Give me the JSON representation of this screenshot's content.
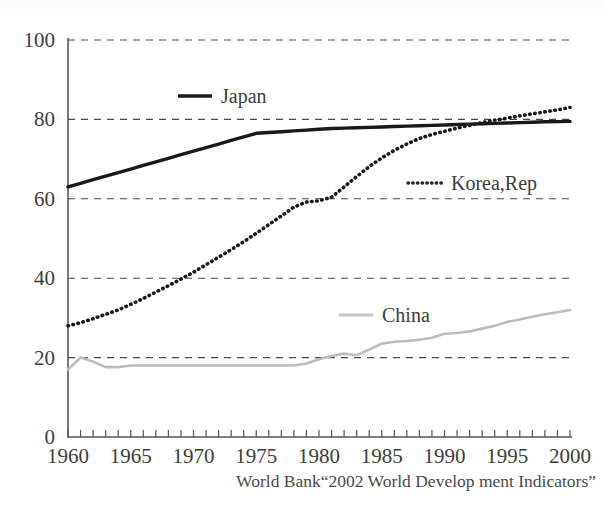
{
  "chart_data": {
    "type": "line",
    "title": "",
    "subtitle": "",
    "xlabel": "",
    "ylabel": "",
    "xlim": [
      1960,
      2000
    ],
    "ylim": [
      0,
      100
    ],
    "grid": true,
    "legend_position": "inline-near-series",
    "x_tick_labels": [
      "1960",
      "1965",
      "1970",
      "1975",
      "1980",
      "1985",
      "1990",
      "1995",
      "2000"
    ],
    "x_tick_values": [
      1960,
      1965,
      1970,
      1975,
      1980,
      1985,
      1990,
      1995,
      2000
    ],
    "x_minor_tick_step": 1,
    "y_tick_labels": [
      "0",
      "20",
      "40",
      "60",
      "80",
      "100"
    ],
    "y_tick_values": [
      0,
      20,
      40,
      60,
      80,
      100
    ],
    "x": [
      1960,
      1961,
      1962,
      1963,
      1964,
      1965,
      1966,
      1967,
      1968,
      1969,
      1970,
      1971,
      1972,
      1973,
      1974,
      1975,
      1976,
      1977,
      1978,
      1979,
      1980,
      1981,
      1982,
      1983,
      1984,
      1985,
      1986,
      1987,
      1988,
      1989,
      1990,
      1991,
      1992,
      1993,
      1994,
      1995,
      1996,
      1997,
      1998,
      1999,
      2000
    ],
    "series": [
      {
        "name": "Japan",
        "style": "solid",
        "color": "#1a1a1a",
        "values": [
          63.0,
          63.9,
          64.8,
          65.7,
          66.6,
          67.5,
          68.4,
          69.3,
          70.2,
          71.1,
          72.0,
          72.9,
          73.8,
          74.7,
          75.6,
          76.5,
          76.7,
          76.9,
          77.1,
          77.3,
          77.5,
          77.7,
          77.8,
          77.9,
          78.0,
          78.1,
          78.2,
          78.3,
          78.4,
          78.5,
          78.6,
          78.7,
          78.8,
          78.9,
          79.0,
          79.1,
          79.2,
          79.3,
          79.4,
          79.45,
          79.5
        ]
      },
      {
        "name": "Korea,Rep",
        "style": "dotted",
        "color": "#1a1a1a",
        "values": [
          28.0,
          28.8,
          29.8,
          30.9,
          32.0,
          33.4,
          34.9,
          36.5,
          38.1,
          39.8,
          41.5,
          43.4,
          45.3,
          47.2,
          49.2,
          51.3,
          53.5,
          55.7,
          57.9,
          59.2,
          59.5,
          60.4,
          63.0,
          65.6,
          68.1,
          70.3,
          72.2,
          73.8,
          75.2,
          76.2,
          77.0,
          77.8,
          78.5,
          79.2,
          79.8,
          80.3,
          80.9,
          81.4,
          81.9,
          82.4,
          83.0
        ]
      },
      {
        "name": "China",
        "style": "solid",
        "color": "#bdbdbd",
        "values": [
          17.0,
          20.0,
          19.0,
          17.6,
          17.6,
          18.0,
          18.0,
          18.0,
          18.0,
          18.0,
          18.0,
          18.0,
          18.0,
          18.0,
          18.0,
          18.0,
          18.0,
          18.0,
          18.0,
          18.5,
          19.6,
          20.4,
          21.0,
          20.6,
          22.0,
          23.5,
          24.0,
          24.2,
          24.5,
          25.0,
          26.0,
          26.2,
          26.6,
          27.3,
          28.0,
          29.0,
          29.6,
          30.3,
          30.9,
          31.4,
          32.0
        ]
      }
    ],
    "annotations": [
      {
        "name": "source-note",
        "text": "World Bank“2002 World Develop ment Indicators”"
      }
    ]
  },
  "axes": {
    "y_ticks": [
      {
        "label": "100",
        "value": 100
      },
      {
        "label": "80",
        "value": 80
      },
      {
        "label": "60",
        "value": 60
      },
      {
        "label": "40",
        "value": 40
      },
      {
        "label": "20",
        "value": 20
      },
      {
        "label": "0",
        "value": 0
      }
    ],
    "x_ticks": [
      {
        "label": "1960",
        "value": 1960
      },
      {
        "label": "1965",
        "value": 1965
      },
      {
        "label": "1970",
        "value": 1970
      },
      {
        "label": "1975",
        "value": 1975
      },
      {
        "label": "1980",
        "value": 1980
      },
      {
        "label": "1985",
        "value": 1985
      },
      {
        "label": "1990",
        "value": 1990
      },
      {
        "label": "1995",
        "value": 1995
      },
      {
        "label": "2000",
        "value": 2000
      }
    ]
  },
  "legend": {
    "items": [
      {
        "label": "Japan",
        "style": "solid",
        "color": "#1a1a1a"
      },
      {
        "label": "Korea,Rep",
        "style": "dotted",
        "color": "#1a1a1a"
      },
      {
        "label": "China",
        "style": "solid",
        "color": "#bdbdbd"
      }
    ]
  },
  "source": {
    "text": "World Bank“2002 World Develop ment Indicators”"
  },
  "colors": {
    "japan": "#1a1a1a",
    "korea": "#1a1a1a",
    "china": "#bdbdbd",
    "grid": "#4a4a4a",
    "axis": "#555555",
    "text": "#3d3d3d",
    "background": "#ffffff"
  }
}
